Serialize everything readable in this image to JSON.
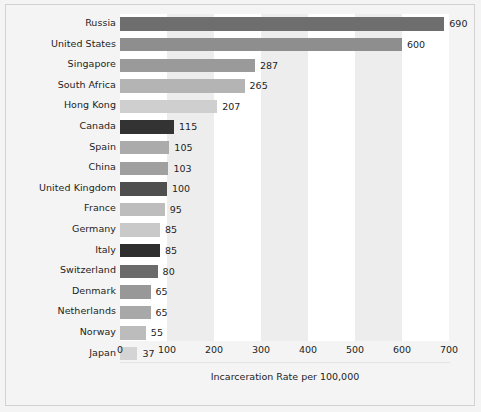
{
  "chart_data": {
    "type": "bar",
    "orientation": "horizontal",
    "title": "",
    "xlabel": "Incarceration Rate per 100,000",
    "ylabel": "",
    "xlim": [
      0,
      700
    ],
    "xticks": [
      "0",
      "100",
      "200",
      "300",
      "400",
      "500",
      "600",
      "700"
    ],
    "grid": false,
    "band_background": true,
    "legend": "none",
    "categories": [
      "Russia",
      "United States",
      "Singapore",
      "South Africa",
      "Hong Kong",
      "Canada",
      "Spain",
      "China",
      "United Kingdom",
      "France",
      "Germany",
      "Italy",
      "Switzerland",
      "Denmark",
      "Netherlands",
      "Norway",
      "Japan"
    ],
    "values": [
      690,
      600,
      287,
      265,
      207,
      115,
      105,
      103,
      100,
      95,
      85,
      85,
      80,
      65,
      65,
      55,
      37
    ],
    "value_labels": [
      "690",
      "600",
      "287",
      "265",
      "207",
      "115",
      "105",
      "103",
      "100",
      "95",
      "85",
      "85",
      "80",
      "65",
      "65",
      "55",
      "37"
    ],
    "bar_colors": [
      "#6e6e6e",
      "#8e8e8e",
      "#9a9a9a",
      "#b4b4b4",
      "#cfcfcf",
      "#333333",
      "#ababab",
      "#a0a0a0",
      "#4f4f4f",
      "#bdbdbd",
      "#c9c9c9",
      "#2e2e2e",
      "#6b6b6b",
      "#989898",
      "#a8a8a8",
      "#bcbcbc",
      "#d4d4d4"
    ]
  },
  "style": {
    "page_background": "#f2f2f2",
    "figure_background": "#f4f4f4",
    "plot_background": "#ffffff",
    "band_color": "#ededed",
    "frame_color": "#d2d2d2",
    "text_color": "#1d1d1d"
  }
}
